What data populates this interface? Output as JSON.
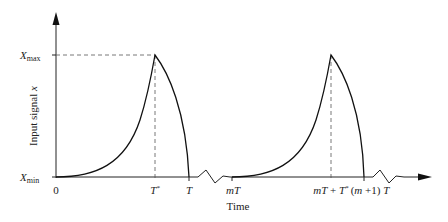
{
  "diagram": {
    "type": "periodic waveform",
    "y_axis": {
      "label_prefix": "Input signal ",
      "label_var": "x",
      "ticks": [
        {
          "base": "X",
          "sub": "max"
        },
        {
          "base": "X",
          "sub": "min"
        }
      ]
    },
    "x_axis": {
      "label": "Time",
      "ticks": [
        "0",
        "T*",
        "T",
        "mT",
        "mT + T*",
        "(m +1) T"
      ]
    },
    "labels": {
      "xmax_base": "X",
      "xmax_sub": "max",
      "xmin_base": "X",
      "xmin_sub": "min",
      "zero": "0",
      "tstar_base": "T",
      "tstar_sup": "*",
      "t": "T",
      "mt": "mT",
      "mt_tstar_a": "mT",
      "mt_tstar_b": " + ",
      "mt_tstar_c": "T",
      "mt_tstar_sup": "*",
      "m1t_open": "(",
      "m1t_m": "m",
      "m1t_rest": " +1) ",
      "m1t_t": "T",
      "time": "Time",
      "ylabel_prefix": "Input signal ",
      "ylabel_var": "x"
    },
    "colors": {
      "line": "#222222",
      "dashed": "#555555"
    }
  }
}
